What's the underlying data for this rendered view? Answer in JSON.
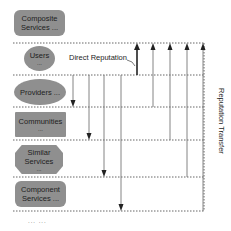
{
  "nodes": [
    {
      "id": "composite",
      "line1": "Composite",
      "line2": "Services ...",
      "shape": "rounded"
    },
    {
      "id": "users",
      "line1": "Users",
      "line2": "...",
      "shape": "ellipse"
    },
    {
      "id": "providers",
      "line1": "Providers ...",
      "line2": "",
      "shape": "ellipse"
    },
    {
      "id": "communities",
      "line1": "Communities",
      "line2": "...",
      "shape": "rect"
    },
    {
      "id": "similar",
      "line1": "Similar",
      "line2": "Services",
      "line3": "...",
      "shape": "octagon"
    },
    {
      "id": "component",
      "line1": "Component",
      "line2": "Services ...",
      "shape": "rounded"
    }
  ],
  "labels": {
    "direct_reputation": "Direct Reputation",
    "reputation_transfer": "Reputation Transfer",
    "more": "... ..."
  },
  "colors": {
    "node_fill": "#8f8f8f",
    "line": "#555555",
    "arrow": "#222222"
  }
}
